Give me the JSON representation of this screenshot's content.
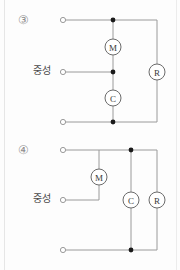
{
  "page": {
    "background_color": "#fdfdfd",
    "wire_color": "#9a9a9a",
    "node_color": "#1a1a1a",
    "label_color": "#4a4a4a",
    "number_color": "#8e8e8e"
  },
  "diagrams": [
    {
      "id": "diagram-3",
      "number_label": "③",
      "neutral_label": "중성",
      "components": [
        {
          "id": "motor",
          "label": "M",
          "name": "motor-component",
          "cx": 113,
          "cy": 47
        },
        {
          "id": "capacitor",
          "label": "C",
          "name": "capacitor-component",
          "cx": 113,
          "cy": 98
        },
        {
          "id": "resistor",
          "label": "R",
          "name": "resistor-component",
          "cx": 157,
          "cy": 72
        }
      ],
      "terminals": [
        {
          "id": "terminal-top",
          "x": 63,
          "y": 20
        },
        {
          "id": "terminal-neutral",
          "x": 63,
          "y": 72
        },
        {
          "id": "terminal-bottom",
          "x": 63,
          "y": 122
        }
      ],
      "junctions": [
        {
          "id": "junction-top",
          "x": 113,
          "y": 20
        },
        {
          "id": "junction-neutral",
          "x": 113,
          "y": 72
        },
        {
          "id": "junction-bottom",
          "x": 113,
          "y": 122
        }
      ]
    },
    {
      "id": "diagram-4",
      "number_label": "④",
      "neutral_label": "중성",
      "components": [
        {
          "id": "motor",
          "label": "M",
          "name": "motor-component",
          "cx": 99,
          "cy": 177
        },
        {
          "id": "capacitor",
          "label": "C",
          "name": "capacitor-component",
          "cx": 131,
          "cy": 200
        },
        {
          "id": "resistor",
          "label": "R",
          "name": "resistor-component",
          "cx": 157,
          "cy": 200
        }
      ],
      "terminals": [
        {
          "id": "terminal-top",
          "x": 63,
          "y": 150
        },
        {
          "id": "terminal-neutral",
          "x": 63,
          "y": 200
        },
        {
          "id": "terminal-bottom",
          "x": 63,
          "y": 250
        }
      ],
      "junctions": [
        {
          "id": "junction-top",
          "x": 131,
          "y": 150
        },
        {
          "id": "junction-bottom",
          "x": 131,
          "y": 250
        }
      ]
    }
  ]
}
